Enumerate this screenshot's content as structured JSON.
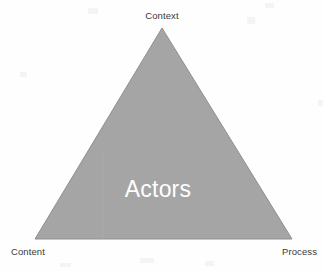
{
  "diagram": {
    "type": "triangle-framework",
    "center_label": "Actors",
    "vertices": [
      {
        "id": "top",
        "label": "Context",
        "x": 162,
        "y": 28
      },
      {
        "id": "bottom-left",
        "label": "Content",
        "x": 35,
        "y": 239
      },
      {
        "id": "bottom-right",
        "label": "Process",
        "x": 292,
        "y": 239
      }
    ],
    "colors": {
      "background": "#fefefe",
      "triangle_fill": "#a5a5a5",
      "triangle_stroke": "#8f8f8f",
      "label_text": "#3a3a3a",
      "center_text": "#ffffff"
    },
    "shape_points": "162,28 292,239 35,239"
  }
}
